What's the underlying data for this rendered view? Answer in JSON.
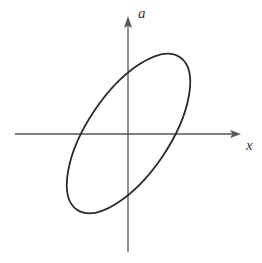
{
  "figure": {
    "kind": "math-diagram",
    "background_color": "#ffffff",
    "axis_color": "#555555",
    "curve_color": "#2a2a2a",
    "label_color": "#3a3a3a"
  },
  "axes": {
    "horizontal": {
      "name": "x-axis",
      "label": "x",
      "start_x": 15,
      "end_x": 240,
      "y": 134,
      "arrow": "right",
      "label_x": 246,
      "label_y": 150
    },
    "vertical": {
      "name": "a-axis",
      "label": "a",
      "x": 128,
      "start_y": 252,
      "end_y": 17,
      "arrow": "up",
      "label_x": 138,
      "label_y": 18
    },
    "origin": {
      "x": 128,
      "y": 134
    }
  },
  "chart_data": {
    "type": "line",
    "title": "",
    "xlabel": "x",
    "ylabel": "a",
    "grid": false,
    "legend": null,
    "axis_origin": [
      128,
      134
    ],
    "curves": [
      {
        "name": "ellipse",
        "shape": "ellipse",
        "closed": true,
        "center": [
          128.5,
          133.5
        ],
        "semi_major": 92,
        "semi_minor": 41,
        "rotation_deg": -56,
        "stroke": "#2a2a2a",
        "stroke_width": 1.8,
        "fill": "none",
        "extreme_points": {
          "topmost": [
            172,
            46
          ],
          "rightmost": [
            197,
            72
          ],
          "bottommost": [
            85,
            221
          ],
          "leftmost": [
            60,
            190
          ]
        },
        "axis_intercepts": {
          "x_axis_left": [
            72,
            134
          ],
          "x_axis_right": [
            180,
            134
          ],
          "a_axis_upper": [
            128,
            68
          ],
          "a_axis_lower": [
            128,
            200
          ]
        }
      }
    ]
  }
}
